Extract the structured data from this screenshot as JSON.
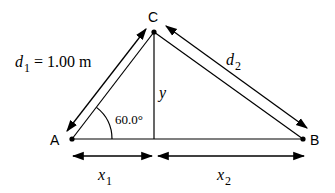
{
  "diagram": {
    "points": {
      "A": {
        "label": "A"
      },
      "B": {
        "label": "B"
      },
      "C": {
        "label": "C"
      }
    },
    "labels": {
      "d1_var": "d",
      "d1_sub": "1",
      "d1_value": " = 1.00 m",
      "d2_var": "d",
      "d2_sub": "2",
      "y_var": "y",
      "x1_var": "x",
      "x1_sub": "1",
      "x2_var": "x",
      "x2_sub": "2",
      "angle": "60.0°"
    },
    "colors": {
      "line": "#000000",
      "background": "#ffffff"
    }
  }
}
